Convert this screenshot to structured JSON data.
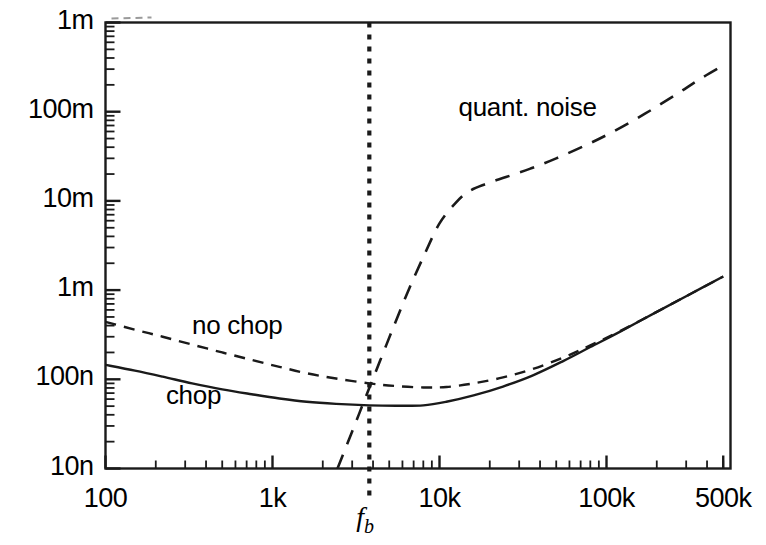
{
  "chart_data": {
    "type": "line",
    "title": "",
    "xlabel": "",
    "ylabel": "",
    "xscale": "log",
    "yscale": "log",
    "xlim": [
      100,
      500000
    ],
    "ylim": [
      1e-08,
      0.001
    ],
    "grid": false,
    "legend_position": "inline-annotations",
    "x_ticks": [
      {
        "value": 100,
        "label": "100"
      },
      {
        "value": 1000,
        "label": "1k"
      },
      {
        "value": 10000,
        "label": "10k"
      },
      {
        "value": 100000,
        "label": "100k"
      },
      {
        "value": 500000,
        "label": "500k"
      }
    ],
    "y_ticks": [
      {
        "value": 0.001,
        "label": "1m"
      },
      {
        "value": 0.0001,
        "label": "100m"
      },
      {
        "value": 1e-05,
        "label": "10m"
      },
      {
        "value": 1e-06,
        "label": "1m"
      },
      {
        "value": 1e-07,
        "label": "100n"
      },
      {
        "value": 1e-08,
        "label": "10n"
      }
    ],
    "annotations": [
      {
        "text": "quant. noise",
        "x": 13000,
        "y": 0.00011
      },
      {
        "text": "no chop",
        "x": 330,
        "y": 4e-07
      },
      {
        "text": "chop",
        "x": 230,
        "y": 6.5e-08
      },
      {
        "text": "fb",
        "x": 3800,
        "y": 1e-08,
        "kind": "axis-marker"
      }
    ],
    "markers": [
      {
        "type": "vline",
        "name": "fb",
        "x": 3800,
        "style": "dotted",
        "label": "f_b"
      }
    ],
    "series": [
      {
        "name": "chop",
        "style": "solid",
        "color": "#1a1a1a",
        "points": [
          [
            100,
            1.45e-07
          ],
          [
            150,
            1.25e-07
          ],
          [
            220,
            1.07e-07
          ],
          [
            330,
            9e-08
          ],
          [
            500,
            7.7e-08
          ],
          [
            750,
            6.8e-08
          ],
          [
            1100,
            6.1e-08
          ],
          [
            1600,
            5.6e-08
          ],
          [
            2400,
            5.3e-08
          ],
          [
            3800,
            5.1e-08
          ],
          [
            5500,
            5.05e-08
          ],
          [
            8000,
            5.1e-08
          ],
          [
            11000,
            5.6e-08
          ],
          [
            16000,
            6.6e-08
          ],
          [
            24000,
            8.3e-08
          ],
          [
            36000,
            1.1e-07
          ],
          [
            55000,
            1.6e-07
          ],
          [
            80000,
            2.3e-07
          ],
          [
            120000,
            3.4e-07
          ],
          [
            200000,
            5.7e-07
          ],
          [
            320000,
            9.1e-07
          ],
          [
            500000,
            1.42e-06
          ]
        ]
      },
      {
        "name": "no chop",
        "style": "dashed-short",
        "color": "#1a1a1a",
        "points": [
          [
            100,
            4.4e-07
          ],
          [
            150,
            3.6e-07
          ],
          [
            220,
            3e-07
          ],
          [
            330,
            2.45e-07
          ],
          [
            500,
            2e-07
          ],
          [
            750,
            1.65e-07
          ],
          [
            1100,
            1.38e-07
          ],
          [
            1600,
            1.17e-07
          ],
          [
            2400,
            1.02e-07
          ],
          [
            3800,
            9e-08
          ],
          [
            5500,
            8.4e-08
          ],
          [
            8000,
            8.1e-08
          ],
          [
            11000,
            8.2e-08
          ],
          [
            16000,
            9e-08
          ],
          [
            24000,
            1.05e-07
          ],
          [
            36000,
            1.3e-07
          ],
          [
            55000,
            1.75e-07
          ],
          [
            80000,
            2.4e-07
          ],
          [
            120000,
            3.45e-07
          ],
          [
            200000,
            5.7e-07
          ],
          [
            320000,
            9.1e-07
          ],
          [
            500000,
            1.42e-06
          ]
        ]
      },
      {
        "name": "quant. noise",
        "style": "dashed-long",
        "color": "#1a1a1a",
        "points": [
          [
            2450,
            1e-08
          ],
          [
            3000,
            2.6e-08
          ],
          [
            3600,
            6.2e-08
          ],
          [
            4400,
            1.6e-07
          ],
          [
            5400,
            4.2e-07
          ],
          [
            6600,
            1.05e-06
          ],
          [
            8200,
            2.6e-06
          ],
          [
            10000,
            5.6e-06
          ],
          [
            12500,
            9.5e-06
          ],
          [
            15000,
            1.28e-05
          ],
          [
            19000,
            1.55e-05
          ],
          [
            25000,
            1.85e-05
          ],
          [
            35000,
            2.3e-05
          ],
          [
            50000,
            3e-05
          ],
          [
            75000,
            4.2e-05
          ],
          [
            110000,
            6e-05
          ],
          [
            170000,
            9.5e-05
          ],
          [
            260000,
            0.000155
          ],
          [
            360000,
            0.00023
          ],
          [
            500000,
            0.00033
          ]
        ]
      }
    ]
  },
  "axes": {
    "frame_color": "#1a1a1a",
    "background": "#ffffff"
  }
}
